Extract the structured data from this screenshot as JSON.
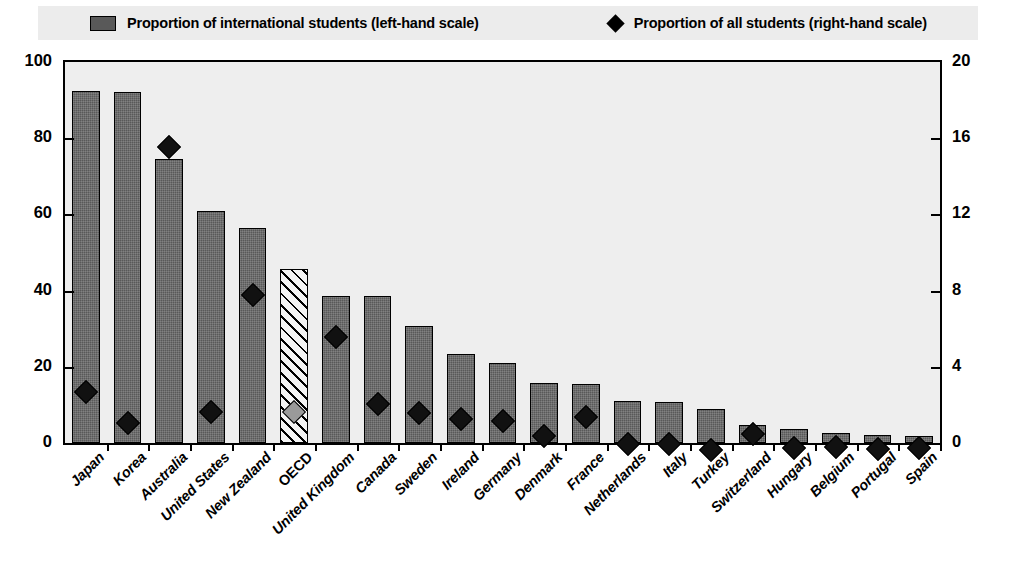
{
  "legend": {
    "items": [
      {
        "label": "Proportion of international students (left-hand scale)",
        "marker": "bar-swatch-icon"
      },
      {
        "label": "Proportion of all students (right-hand scale)",
        "marker": "diamond-icon"
      }
    ]
  },
  "axes": {
    "left_ticks": [
      "0",
      "20",
      "40",
      "60",
      "80",
      "100"
    ],
    "right_ticks": [
      "0",
      "4",
      "8",
      "12",
      "16",
      "20"
    ]
  },
  "chart_data": {
    "type": "bar",
    "title": "",
    "subtitle": "",
    "xlabel": "",
    "ylabel": "",
    "y2label": "",
    "ylim": [
      0,
      100
    ],
    "y2lim": [
      0,
      20
    ],
    "grid": false,
    "legend_position": "top",
    "categories": [
      "Japan",
      "Korea",
      "Australia",
      "United States",
      "New Zealand",
      "OECD",
      "United Kingdom",
      "Canada",
      "Sweden",
      "Ireland",
      "Germany",
      "Denmark",
      "France",
      "Netherlands",
      "Italy",
      "Turkey",
      "Switzerland",
      "Hungary",
      "Belgium",
      "Portugal",
      "Spain"
    ],
    "highlighted_category": "OECD",
    "series": [
      {
        "name": "Proportion of international students (left-hand scale)",
        "axis": "left",
        "type": "bar",
        "values": [
          92.4,
          92.2,
          74.5,
          61.0,
          56.5,
          45.8,
          38.6,
          38.5,
          30.8,
          23.4,
          21.0,
          15.8,
          15.4,
          11.1,
          10.7,
          8.8,
          4.8,
          3.6,
          2.5,
          2.1,
          1.8
        ]
      },
      {
        "name": "Proportion of all students (right-hand scale)",
        "axis": "right",
        "type": "scatter",
        "marker": "diamond",
        "values": [
          3.1,
          1.5,
          16.0,
          2.1,
          8.2,
          2.1,
          6.0,
          2.5,
          2.0,
          1.7,
          1.6,
          0.8,
          1.8,
          0.4,
          0.4,
          0.1,
          0.9,
          0.2,
          0.25,
          0.15,
          0.2
        ]
      }
    ]
  },
  "style": {
    "bar_fill": "#595959",
    "oecd_bar_fill": "#f4f4f4",
    "diamond_fill": "#111111",
    "oecd_diamond_fill": "#9a9a9a",
    "plot_background": "#eeeeee",
    "legend_background": "#ececec",
    "axis_color": "#000000"
  }
}
